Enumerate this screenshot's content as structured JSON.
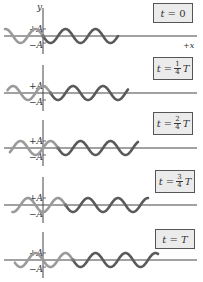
{
  "figure": {
    "axis_labels": {
      "y": "y",
      "x": "+x",
      "plus_amp": "+A",
      "minus_amp": "−A"
    },
    "wave": {
      "color_old": "#9a9a9a",
      "color_new": "#5a5a5a",
      "wavelength_px": 30,
      "amplitude_px": 7
    },
    "panels": [
      {
        "id": "t0",
        "time_label": "t = 0",
        "t_prefix": "t =",
        "num": "",
        "den": "",
        "suffix": "0",
        "axis_y": 36,
        "box_top": 3,
        "box_left": 153,
        "wave_end": 118,
        "phase_shift": 0,
        "show_x_label": true,
        "show_y_label": true
      },
      {
        "id": "t1",
        "time_label": "t = 1/4 T",
        "t_prefix": "t =",
        "num": "1",
        "den": "4",
        "suffix": "T",
        "axis_y": 93,
        "box_top": 57,
        "box_left": 153,
        "wave_end": 128,
        "phase_shift": 7.5,
        "show_x_label": false,
        "show_y_label": false
      },
      {
        "id": "t2",
        "time_label": "t = 2/4 T",
        "t_prefix": "t =",
        "num": "2",
        "den": "4",
        "suffix": "T",
        "axis_y": 148,
        "box_top": 112,
        "box_left": 153,
        "wave_end": 138,
        "phase_shift": 15,
        "show_x_label": false,
        "show_y_label": false
      },
      {
        "id": "t3",
        "time_label": "t = 3/4 T",
        "t_prefix": "t =",
        "num": "3",
        "den": "4",
        "suffix": "T",
        "axis_y": 205,
        "box_top": 170,
        "box_left": 155,
        "wave_end": 148,
        "phase_shift": 22.5,
        "show_x_label": false,
        "show_y_label": false
      },
      {
        "id": "t4",
        "time_label": "t = T",
        "t_prefix": "t =",
        "num": "",
        "den": "",
        "suffix": "T",
        "axis_y": 260,
        "box_top": 229,
        "box_left": 155,
        "wave_end": 158,
        "phase_shift": 30,
        "show_x_label": false,
        "show_y_label": false
      }
    ]
  }
}
